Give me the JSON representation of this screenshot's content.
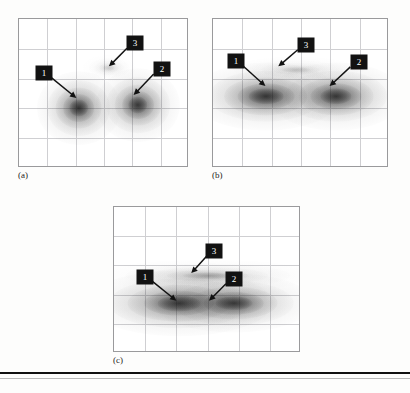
{
  "figure": {
    "kind": "scanned-figure",
    "background_color": "#fdfdfc",
    "frame_color": "#9a9a9c",
    "grid_color": "#cfcfd2",
    "callout_box_color": "#121212",
    "callout_text_color": "#ffffff",
    "blob_color": "#1a1a1a",
    "footer_rule_color": "#101010"
  },
  "panels": [
    {
      "id": "a",
      "label": "(a)",
      "rect": {
        "x": 18,
        "y": 18,
        "w": 170,
        "h": 149
      },
      "label_pos": {
        "x": 18,
        "y": 170
      },
      "grid": {
        "cols": 6,
        "rows": 5
      },
      "callouts": [
        {
          "number": "1",
          "box": {
            "x": 25,
            "y": 54
          },
          "size": {
            "w": 17,
            "h": 15
          },
          "arrow_to": {
            "x": 58,
            "y": 80
          }
        },
        {
          "number": "2",
          "box": {
            "x": 143,
            "y": 50
          },
          "size": {
            "w": 17,
            "h": 15
          },
          "arrow_to": {
            "x": 116,
            "y": 77
          }
        },
        {
          "number": "3",
          "box": {
            "x": 116,
            "y": 24
          },
          "size": {
            "w": 17,
            "h": 15
          },
          "arrow_to": {
            "x": 91,
            "y": 48
          }
        }
      ]
    },
    {
      "id": "b",
      "label": "(b)",
      "rect": {
        "x": 212,
        "y": 18,
        "w": 176,
        "h": 149
      },
      "label_pos": {
        "x": 212,
        "y": 170
      },
      "grid": {
        "cols": 6,
        "rows": 5
      },
      "callouts": [
        {
          "number": "1",
          "box": {
            "x": 23,
            "y": 42
          },
          "size": {
            "w": 17,
            "h": 15
          },
          "arrow_to": {
            "x": 53,
            "y": 68
          }
        },
        {
          "number": "2",
          "box": {
            "x": 146,
            "y": 43
          },
          "size": {
            "w": 17,
            "h": 15
          },
          "arrow_to": {
            "x": 118,
            "y": 68
          }
        },
        {
          "number": "3",
          "box": {
            "x": 93,
            "y": 26
          },
          "size": {
            "w": 17,
            "h": 15
          },
          "arrow_to": {
            "x": 66,
            "y": 48
          }
        }
      ]
    },
    {
      "id": "c",
      "label": "(c)",
      "rect": {
        "x": 113,
        "y": 206,
        "w": 187,
        "h": 146
      },
      "label_pos": {
        "x": 113,
        "y": 355
      },
      "grid": {
        "cols": 6,
        "rows": 5
      },
      "callouts": [
        {
          "number": "1",
          "box": {
            "x": 31,
            "y": 70
          },
          "size": {
            "w": 17,
            "h": 15
          },
          "arrow_to": {
            "x": 63,
            "y": 95
          }
        },
        {
          "number": "2",
          "box": {
            "x": 120,
            "y": 72
          },
          "size": {
            "w": 17,
            "h": 15
          },
          "arrow_to": {
            "x": 96,
            "y": 95
          }
        },
        {
          "number": "3",
          "box": {
            "x": 100,
            "y": 44
          },
          "size": {
            "w": 17,
            "h": 15
          },
          "arrow_to": {
            "x": 78,
            "y": 67
          }
        }
      ]
    }
  ],
  "chart_data": {
    "type": "scatter",
    "title": "",
    "xlabel": "",
    "ylabel": "",
    "grid": true,
    "legend": "none",
    "subplots": [
      {
        "id": "a",
        "label": "(a)",
        "clusters": [
          {
            "name": "1",
            "cx_frac": 0.35,
            "cy_frac": 0.6,
            "rx_frac": 0.11,
            "ry_frac": 0.11,
            "intensity": 0.95
          },
          {
            "name": "2",
            "cx_frac": 0.7,
            "cy_frac": 0.58,
            "rx_frac": 0.11,
            "ry_frac": 0.11,
            "intensity": 0.92
          },
          {
            "name": "3",
            "cx_frac": 0.53,
            "cy_frac": 0.33,
            "rx_frac": 0.07,
            "ry_frac": 0.04,
            "intensity": 0.16
          }
        ]
      },
      {
        "id": "b",
        "label": "(b)",
        "clusters": [
          {
            "name": "1",
            "cx_frac": 0.3,
            "cy_frac": 0.52,
            "rx_frac": 0.19,
            "ry_frac": 0.1,
            "intensity": 0.95
          },
          {
            "name": "2",
            "cx_frac": 0.7,
            "cy_frac": 0.52,
            "rx_frac": 0.17,
            "ry_frac": 0.1,
            "intensity": 0.93
          },
          {
            "name": "3",
            "cx_frac": 0.47,
            "cy_frac": 0.34,
            "rx_frac": 0.16,
            "ry_frac": 0.04,
            "intensity": 0.18
          }
        ]
      },
      {
        "id": "c",
        "label": "(c)",
        "clusters": [
          {
            "name": "1",
            "cx_frac": 0.35,
            "cy_frac": 0.66,
            "rx_frac": 0.22,
            "ry_frac": 0.1,
            "intensity": 0.92
          },
          {
            "name": "2",
            "cx_frac": 0.64,
            "cy_frac": 0.66,
            "rx_frac": 0.19,
            "ry_frac": 0.09,
            "intensity": 0.88
          },
          {
            "name": "3",
            "cx_frac": 0.5,
            "cy_frac": 0.47,
            "rx_frac": 0.26,
            "ry_frac": 0.05,
            "intensity": 0.3
          }
        ]
      }
    ]
  },
  "footer": {
    "rule_y": 372,
    "thin_rule_y": 378
  }
}
